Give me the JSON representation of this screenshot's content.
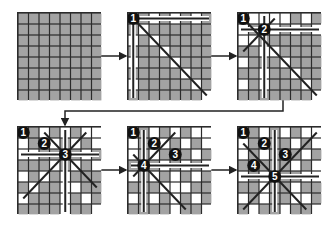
{
  "diagram": {
    "colors": {
      "cell_default": "#a3a3a3",
      "cell_attacked": "#ffffff",
      "grid_line": "#2b2b2b",
      "queen_fill": "#111111",
      "queen_text": "#ffffff",
      "attack_line": "#222222"
    },
    "board_size": 8,
    "boards": [
      {
        "id": 1,
        "x": 17,
        "y": 12,
        "queens": [],
        "white": []
      },
      {
        "id": 2,
        "x": 127,
        "y": 12,
        "queens": [
          {
            "label": "1",
            "r": 0,
            "c": 0
          }
        ],
        "white": [
          [
            0,
            2
          ],
          [
            0,
            4
          ],
          [
            0,
            6
          ],
          [
            2,
            0
          ],
          [
            4,
            0
          ],
          [
            6,
            0
          ],
          [
            1,
            1
          ],
          [
            2,
            2
          ],
          [
            3,
            3
          ],
          [
            4,
            4
          ],
          [
            5,
            5
          ],
          [
            6,
            6
          ],
          [
            7,
            7
          ]
        ],
        "lines": [
          {
            "type": "row",
            "r": 0
          },
          {
            "type": "col",
            "c": 0
          },
          {
            "type": "diag",
            "r": 0,
            "c": 0
          }
        ]
      },
      {
        "id": 3,
        "x": 237,
        "y": 12,
        "queens": [
          {
            "label": "1",
            "r": 0,
            "c": 0
          },
          {
            "label": "2",
            "r": 1,
            "c": 2
          }
        ],
        "white": [
          [
            0,
            2
          ],
          [
            0,
            4
          ],
          [
            0,
            6
          ],
          [
            1,
            0
          ],
          [
            1,
            3
          ],
          [
            1,
            5
          ],
          [
            1,
            7
          ],
          [
            2,
            0
          ],
          [
            3,
            3
          ],
          [
            4,
            0
          ],
          [
            4,
            4
          ],
          [
            5,
            5
          ],
          [
            6,
            0
          ],
          [
            6,
            6
          ],
          [
            7,
            7
          ],
          [
            3,
            2
          ],
          [
            5,
            2
          ],
          [
            6,
            2
          ],
          [
            2,
            1
          ],
          [
            0,
            1
          ],
          [
            0,
            3
          ]
        ],
        "lines": [
          {
            "type": "row",
            "r": 1
          },
          {
            "type": "col",
            "c": 2
          },
          {
            "type": "diag",
            "r": 0,
            "c": 0
          },
          {
            "type": "anti",
            "r": 1,
            "c": 2
          }
        ]
      },
      {
        "id": 4,
        "x": 17,
        "y": 126,
        "queens": [
          {
            "label": "1",
            "r": 0,
            "c": 0
          },
          {
            "label": "2",
            "r": 1,
            "c": 2
          },
          {
            "label": "3",
            "r": 2,
            "c": 4
          }
        ],
        "white": [
          [
            0,
            2
          ],
          [
            0,
            4
          ],
          [
            0,
            6
          ],
          [
            1,
            0
          ],
          [
            1,
            3
          ],
          [
            1,
            5
          ],
          [
            1,
            7
          ],
          [
            2,
            0
          ],
          [
            2,
            1
          ],
          [
            2,
            6
          ],
          [
            3,
            3
          ],
          [
            3,
            5
          ],
          [
            4,
            0
          ],
          [
            4,
            4
          ],
          [
            4,
            2
          ],
          [
            5,
            5
          ],
          [
            5,
            1
          ],
          [
            6,
            0
          ],
          [
            6,
            6
          ],
          [
            6,
            4
          ],
          [
            7,
            7
          ],
          [
            0,
            7
          ],
          [
            3,
            7
          ],
          [
            5,
            4
          ],
          [
            7,
            4
          ]
        ],
        "lines": [
          {
            "type": "row",
            "r": 2
          },
          {
            "type": "col",
            "c": 4
          },
          {
            "type": "diag",
            "r": 2,
            "c": 4
          },
          {
            "type": "anti",
            "r": 2,
            "c": 4
          }
        ]
      },
      {
        "id": 5,
        "x": 127,
        "y": 126,
        "queens": [
          {
            "label": "1",
            "r": 0,
            "c": 0
          },
          {
            "label": "2",
            "r": 1,
            "c": 2
          },
          {
            "label": "3",
            "r": 2,
            "c": 4
          },
          {
            "label": "4",
            "r": 3,
            "c": 1
          }
        ],
        "white": [
          [
            0,
            2
          ],
          [
            0,
            4
          ],
          [
            0,
            6
          ],
          [
            1,
            0
          ],
          [
            1,
            3
          ],
          [
            1,
            5
          ],
          [
            1,
            7
          ],
          [
            2,
            0
          ],
          [
            2,
            6
          ],
          [
            3,
            3
          ],
          [
            3,
            5
          ],
          [
            3,
            7
          ],
          [
            4,
            0
          ],
          [
            4,
            4
          ],
          [
            4,
            2
          ],
          [
            5,
            5
          ],
          [
            5,
            3
          ],
          [
            6,
            0
          ],
          [
            6,
            6
          ],
          [
            6,
            4
          ],
          [
            7,
            7
          ],
          [
            0,
            7
          ],
          [
            5,
            4
          ],
          [
            7,
            4
          ],
          [
            2,
            2
          ],
          [
            4,
            6
          ],
          [
            6,
            2
          ]
        ],
        "lines": [
          {
            "type": "row",
            "r": 3
          },
          {
            "type": "col",
            "c": 1
          },
          {
            "type": "diag",
            "r": 3,
            "c": 1
          },
          {
            "type": "anti",
            "r": 3,
            "c": 1
          }
        ]
      },
      {
        "id": 6,
        "x": 237,
        "y": 126,
        "queens": [
          {
            "label": "1",
            "r": 0,
            "c": 0
          },
          {
            "label": "2",
            "r": 1,
            "c": 2
          },
          {
            "label": "3",
            "r": 2,
            "c": 4
          },
          {
            "label": "4",
            "r": 3,
            "c": 1
          },
          {
            "label": "5",
            "r": 4,
            "c": 3
          }
        ],
        "white": [
          [
            0,
            2
          ],
          [
            0,
            4
          ],
          [
            0,
            6
          ],
          [
            1,
            0
          ],
          [
            1,
            5
          ],
          [
            1,
            7
          ],
          [
            2,
            0
          ],
          [
            2,
            6
          ],
          [
            3,
            5
          ],
          [
            3,
            7
          ],
          [
            4,
            0
          ],
          [
            4,
            2
          ],
          [
            5,
            5
          ],
          [
            6,
            0
          ],
          [
            6,
            6
          ],
          [
            7,
            7
          ],
          [
            0,
            7
          ],
          [
            7,
            4
          ],
          [
            2,
            2
          ],
          [
            4,
            6
          ],
          [
            6,
            2
          ],
          [
            7,
            1
          ],
          [
            5,
            2
          ],
          [
            6,
            5
          ],
          [
            4,
            7
          ]
        ],
        "lines": [
          {
            "type": "row",
            "r": 4
          },
          {
            "type": "col",
            "c": 3
          },
          {
            "type": "diag",
            "r": 4,
            "c": 3
          },
          {
            "type": "anti",
            "r": 4,
            "c": 3
          }
        ]
      }
    ],
    "arrows": [
      {
        "from": 1,
        "to": 2
      },
      {
        "from": 2,
        "to": 3
      },
      {
        "from": 3,
        "to": 4,
        "type": "wrap"
      },
      {
        "from": 4,
        "to": 5
      },
      {
        "from": 5,
        "to": 6
      }
    ]
  }
}
